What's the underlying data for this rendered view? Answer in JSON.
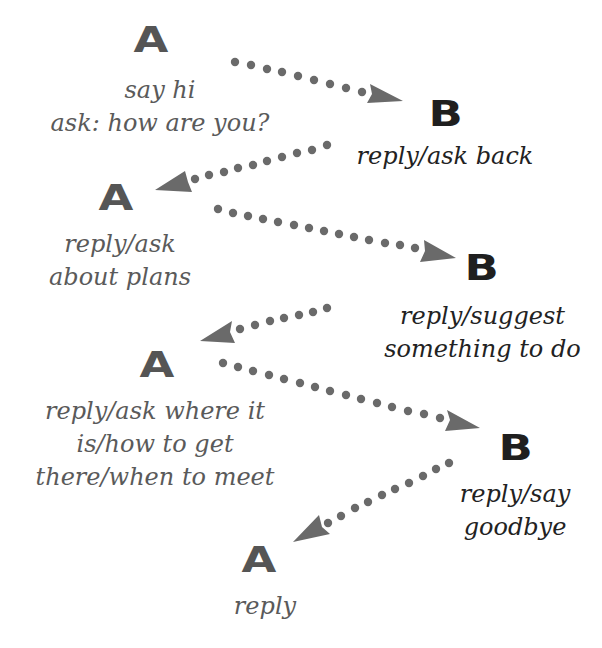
{
  "colors": {
    "speaker_a": "#555555",
    "speaker_b": "#1f1f1f",
    "text_a": "#5a5a5a",
    "text_b": "#222222",
    "arrow": "#6a6a6a"
  },
  "nodes": [
    {
      "speaker": "A",
      "lines": [
        "say hi",
        "ask: how are you?"
      ]
    },
    {
      "speaker": "B",
      "lines": [
        "reply/ask back"
      ]
    },
    {
      "speaker": "A",
      "lines": [
        "reply/ask",
        "about plans"
      ]
    },
    {
      "speaker": "B",
      "lines": [
        "reply/suggest",
        "something to do"
      ]
    },
    {
      "speaker": "A",
      "lines": [
        "reply/ask where it",
        "is/how to get",
        "there/when to meet"
      ]
    },
    {
      "speaker": "B",
      "lines": [
        "reply/say",
        "goodbye"
      ]
    },
    {
      "speaker": "A",
      "lines": [
        "reply"
      ]
    }
  ],
  "arrows": [
    {
      "from": "A1",
      "to": "B1",
      "direction": "right"
    },
    {
      "from": "B1",
      "to": "A2",
      "direction": "left"
    },
    {
      "from": "A2",
      "to": "B2",
      "direction": "right"
    },
    {
      "from": "B2",
      "to": "A3",
      "direction": "left"
    },
    {
      "from": "A3",
      "to": "B3",
      "direction": "right"
    },
    {
      "from": "B3",
      "to": "A4",
      "direction": "left"
    }
  ]
}
